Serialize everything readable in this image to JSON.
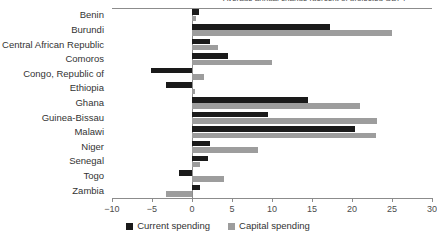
{
  "chart_data": {
    "type": "bar",
    "orientation": "horizontal",
    "grouped": true,
    "title": "Average annual change (percent of projected GDP)",
    "xlabel": "",
    "ylabel": "",
    "xlim": [
      -10,
      30
    ],
    "xticks": [
      -10,
      -5,
      0,
      5,
      10,
      15,
      20,
      25,
      30
    ],
    "xtick_labels": [
      "−10",
      "−5",
      "0",
      "5",
      "10",
      "15",
      "20",
      "25",
      "30"
    ],
    "grid": false,
    "zero_line": true,
    "legend_position": "bottom",
    "categories": [
      "Benin",
      "Burundi",
      "Central African Republic",
      "Comoros",
      "Congo, Republic of",
      "Ethiopia",
      "Ghana",
      "Guinea-Bissau",
      "Malawi",
      "Niger",
      "Senegal",
      "Togo",
      "Zambia"
    ],
    "series": [
      {
        "name": "Current spending",
        "color": "#1a1a1a",
        "values": [
          0.9,
          17.3,
          2.2,
          4.5,
          -5.1,
          -3.2,
          14.5,
          9.5,
          20.4,
          2.3,
          2.0,
          -1.6,
          1.0
        ]
      },
      {
        "name": "Capital spending",
        "color": "#9d9d9d",
        "values": [
          0.5,
          25.0,
          3.2,
          10.0,
          1.5,
          0.4,
          21.0,
          23.1,
          23.0,
          8.3,
          1.0,
          4.0,
          -3.3
        ]
      }
    ]
  },
  "legend": {
    "items": [
      {
        "label": "Current spending",
        "color": "#1a1a1a"
      },
      {
        "label": "Capital spending",
        "color": "#9d9d9d"
      }
    ]
  }
}
